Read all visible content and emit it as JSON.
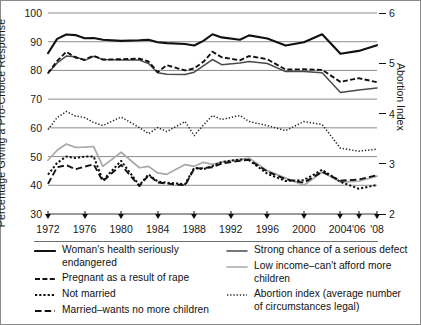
{
  "axes": {
    "left_title": "Percentage  Giving a Pro-Choice Response",
    "right_title": "Abortion Index",
    "left_ticks": [
      "100",
      "90",
      "80",
      "70",
      "60",
      "50",
      "40",
      "30"
    ],
    "right_ticks": [
      "6",
      "5",
      "4",
      "3",
      "2"
    ],
    "x_ticks": [
      "1972",
      "1976",
      "1980",
      "1984",
      "1988",
      "1992",
      "1996",
      "2000",
      "2004",
      "'06",
      "'08"
    ]
  },
  "legend": {
    "left": [
      {
        "label": "Woman's health seriously endangered",
        "style": "solid-black",
        "color": "#111111"
      },
      {
        "label": "Pregnant as a result of rape",
        "style": "dashed-black",
        "color": "#111111"
      },
      {
        "label": "Not married",
        "style": "dotted-square-black",
        "color": "#111111"
      },
      {
        "label": "Married–wants no more children",
        "style": "longdash-black",
        "color": "#111111"
      }
    ],
    "right": [
      {
        "label": "Strong chance of a serious defect",
        "style": "solid-dark",
        "color": "#4a4a4a"
      },
      {
        "label": "Low income–can't afford more children",
        "style": "solid-gray",
        "color": "#a9a9a9"
      },
      {
        "label": "Abortion index (average number of circumstances legal)",
        "style": "fine-dotted",
        "color": "#222222"
      }
    ]
  },
  "chart_data": {
    "type": "line",
    "title": "",
    "xlabel": "",
    "ylabel": "Percentage  Giving a Pro-Choice Response",
    "y2label": "Abortion Index",
    "ylim": [
      30,
      100
    ],
    "y2lim": [
      2,
      6
    ],
    "grid": "horizontal",
    "legend_position": "below",
    "x": [
      1972,
      1973,
      1974,
      1975,
      1976,
      1977,
      1978,
      1980,
      1982,
      1983,
      1984,
      1985,
      1987,
      1988,
      1989,
      1990,
      1991,
      1993,
      1994,
      1996,
      1998,
      2000,
      2002,
      2004,
      2006,
      2008
    ],
    "x_labels": [
      "1972",
      "1973",
      "1974",
      "1975",
      "1976",
      "1977",
      "1978",
      "1980",
      "1982",
      "1983",
      "1984",
      "1985",
      "1987",
      "1988",
      "1989",
      "1990",
      "1991",
      "1993",
      "1994",
      "1996",
      "1998",
      "2000",
      "2002",
      "2004",
      "2006",
      "2008"
    ],
    "series": [
      {
        "name": "Woman's health seriously endangered",
        "color": "#111111",
        "style": "solid-black",
        "axis": "left",
        "values": [
          86,
          91,
          92.5,
          92.3,
          91.2,
          91.3,
          90.7,
          90.3,
          90.5,
          90.7,
          89.8,
          89.5,
          89.2,
          88.7,
          90.3,
          92.6,
          91.5,
          90.7,
          92.2,
          91.1,
          88.7,
          89.8,
          92.6,
          85.8,
          86.8,
          88.8
        ]
      },
      {
        "name": "Strong chance of a serious defect",
        "color": "#4a4a4a",
        "style": "solid-dark",
        "axis": "left",
        "values": [
          79,
          82.6,
          85,
          84.8,
          83.5,
          84.9,
          83.8,
          83.6,
          83.6,
          82.4,
          79.2,
          78.7,
          78.6,
          79.4,
          81.6,
          83.8,
          82,
          82.6,
          83.1,
          82.4,
          79.6,
          79.6,
          79.2,
          72.3,
          73.2,
          73.9
        ]
      },
      {
        "name": "Pregnant as a result of rape",
        "color": "#111111",
        "style": "dashed-black",
        "axis": "left",
        "values": [
          79,
          83.3,
          86.5,
          84.5,
          83.7,
          85.1,
          83.8,
          83.9,
          84.1,
          83.1,
          79.4,
          81.8,
          80,
          80.7,
          83,
          86.5,
          84.6,
          83.5,
          85,
          83.9,
          80.3,
          80.4,
          80.2,
          76,
          77.3,
          75.9
        ]
      },
      {
        "name": "Abortion index (average number of circumstances legal)",
        "color": "#222222",
        "style": "fine-dotted",
        "axis": "right",
        "values": [
          3.68,
          3.92,
          4.04,
          3.95,
          3.92,
          3.82,
          3.76,
          3.93,
          3.72,
          3.6,
          3.72,
          3.64,
          3.84,
          3.56,
          3.77,
          3.96,
          3.88,
          3.96,
          3.84,
          3.76,
          3.66,
          3.84,
          3.78,
          3.31,
          3.25,
          3.29
        ]
      },
      {
        "name": "Low income–can't afford more children",
        "color": "#a9a9a9",
        "style": "solid-gray",
        "axis": "left",
        "values": [
          48.7,
          52.2,
          54.4,
          53.2,
          53.3,
          53.5,
          46.6,
          51.5,
          46.1,
          46.6,
          44.3,
          43.8,
          47.2,
          46.6,
          48,
          47.3,
          48.1,
          49,
          49.5,
          45.1,
          42.5,
          40,
          44.6,
          41.1,
          41.4,
          43.2
        ]
      },
      {
        "name": "Not married",
        "color": "#111111",
        "style": "dotted-square-black",
        "axis": "left",
        "values": [
          43.7,
          47.8,
          50,
          49.5,
          50,
          50,
          41.7,
          48.5,
          40,
          43.8,
          41.3,
          40.9,
          40.4,
          46.1,
          45.6,
          46.7,
          48.1,
          49,
          48.7,
          44,
          41.5,
          41.8,
          45.4,
          41.2,
          38.8,
          40.1
        ]
      },
      {
        "name": "Married–wants no more children",
        "color": "#111111",
        "style": "longdash-black",
        "axis": "left",
        "values": [
          40.5,
          46.3,
          47,
          45.6,
          46.5,
          47.3,
          41.4,
          47.1,
          39.7,
          43.5,
          41,
          40.6,
          40,
          45.8,
          46,
          46.3,
          47.6,
          48.5,
          48.9,
          44.8,
          42.1,
          40.9,
          44.7,
          41.6,
          42,
          43.5
        ]
      }
    ]
  }
}
